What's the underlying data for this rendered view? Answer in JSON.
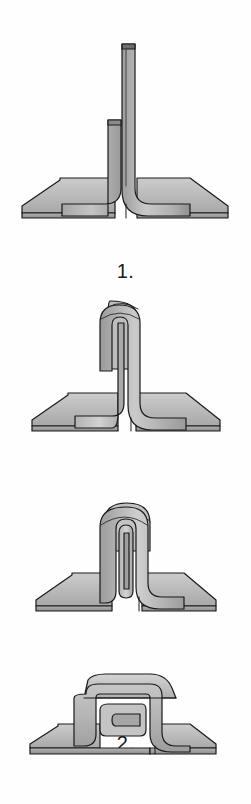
{
  "illustration": {
    "title": "Folded sheet-metal seam forming sequence",
    "background_color": "#fefefe",
    "outline_color": "#1a1a1a",
    "metal_light": "#d9d9d9",
    "metal_mid": "#b8b8b8",
    "metal_dark": "#9a9a9a",
    "metal_shadow": "#8a8a8a",
    "caption_color": "#1a1a1a"
  },
  "figures": [
    {
      "id": "figure-1",
      "caption": "1.",
      "name": "upright-flange-seam-step-1",
      "description": "Two sheets with vertical upstanding flanges, one taller than the other"
    },
    {
      "id": "figure-2",
      "caption": "2.",
      "name": "single-fold-seam-step-2",
      "description": "Taller flange folded over the shorter one forming a single hook"
    },
    {
      "id": "figure-3",
      "caption": "3.",
      "name": "double-fold-seam-step-3",
      "description": "Folded flange bent a second time creating a double standing seam"
    },
    {
      "id": "figure-4",
      "caption": "4.",
      "name": "flattened-seam-step-4",
      "description": "Standing seam folded flat against the sheet surface"
    }
  ]
}
